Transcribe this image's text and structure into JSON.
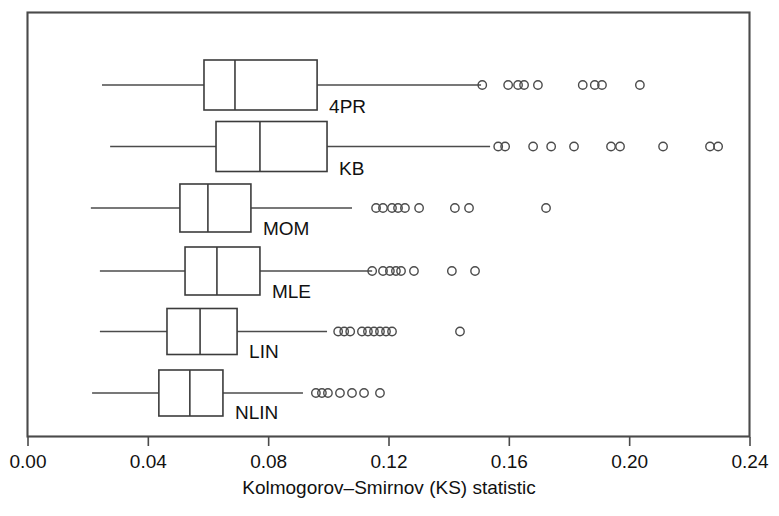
{
  "chart_data": {
    "type": "box",
    "orientation": "horizontal",
    "title": "",
    "xlabel": "Kolmogorov–Smirnov (KS) statistic",
    "ylabel": "",
    "xlim": [
      0.0,
      0.24
    ],
    "xticks": [
      0.0,
      0.04,
      0.08,
      0.12,
      0.16,
      0.2,
      0.24
    ],
    "xtick_labels": [
      "0.00",
      "0.04",
      "0.08",
      "0.12",
      "0.16",
      "0.20",
      "0.24"
    ],
    "grid": false,
    "legend": "none",
    "frame": "box",
    "categories": [
      "4PR",
      "KB",
      "MOM",
      "MLE",
      "LIN",
      "NLIN"
    ],
    "boxes": [
      {
        "label": "4PR",
        "whisker_low": 0.0246,
        "q1": 0.0585,
        "median": 0.0688,
        "q3": 0.0961,
        "whisker_high": 0.1506,
        "outliers": [
          0.151,
          0.1596,
          0.1629,
          0.1649,
          0.1695,
          0.1844,
          0.1884,
          0.1908,
          0.2034
        ]
      },
      {
        "label": "KB",
        "whisker_low": 0.0273,
        "q1": 0.0625,
        "median": 0.0771,
        "q3": 0.0994,
        "whisker_high": 0.1536,
        "outliers": [
          0.1563,
          0.1586,
          0.1679,
          0.1739,
          0.1815,
          0.1938,
          0.1968,
          0.2111,
          0.2267,
          0.2294
        ]
      },
      {
        "label": "MOM",
        "whisker_low": 0.0209,
        "q1": 0.0505,
        "median": 0.0598,
        "q3": 0.0741,
        "whisker_high": 0.1077,
        "outliers": [
          0.1157,
          0.118,
          0.121,
          0.123,
          0.1253,
          0.13,
          0.1419,
          0.1466,
          0.1722
        ]
      },
      {
        "label": "MLE",
        "whisker_low": 0.0239,
        "q1": 0.0522,
        "median": 0.0628,
        "q3": 0.0771,
        "whisker_high": 0.1144,
        "outliers": [
          0.1144,
          0.118,
          0.1203,
          0.1223,
          0.124,
          0.1283,
          0.1409,
          0.1486
        ]
      },
      {
        "label": "LIN",
        "whisker_low": 0.0239,
        "q1": 0.0462,
        "median": 0.0572,
        "q3": 0.0695,
        "whisker_high": 0.0994,
        "outliers": [
          0.1031,
          0.1051,
          0.1071,
          0.111,
          0.113,
          0.115,
          0.117,
          0.119,
          0.121,
          0.1436
        ]
      },
      {
        "label": "NLIN",
        "whisker_low": 0.0213,
        "q1": 0.0435,
        "median": 0.0538,
        "q3": 0.0648,
        "whisker_high": 0.0914,
        "outliers": [
          0.0957,
          0.0977,
          0.0997,
          0.1037,
          0.1077,
          0.1117,
          0.117
        ]
      }
    ]
  },
  "axis": {
    "x_title": "Kolmogorov–Smirnov (KS) statistic",
    "tick_labels": [
      "0.00",
      "0.04",
      "0.08",
      "0.12",
      "0.16",
      "0.20",
      "0.24"
    ]
  },
  "labels": {
    "g0": "4PR",
    "g1": "KB",
    "g2": "MOM",
    "g3": "MLE",
    "g4": "LIN",
    "g5": "NLIN"
  },
  "colors": {
    "background": "#ffffff",
    "frame": "#4a4a4a",
    "line": "#3c3c3c",
    "text": "#111111"
  }
}
